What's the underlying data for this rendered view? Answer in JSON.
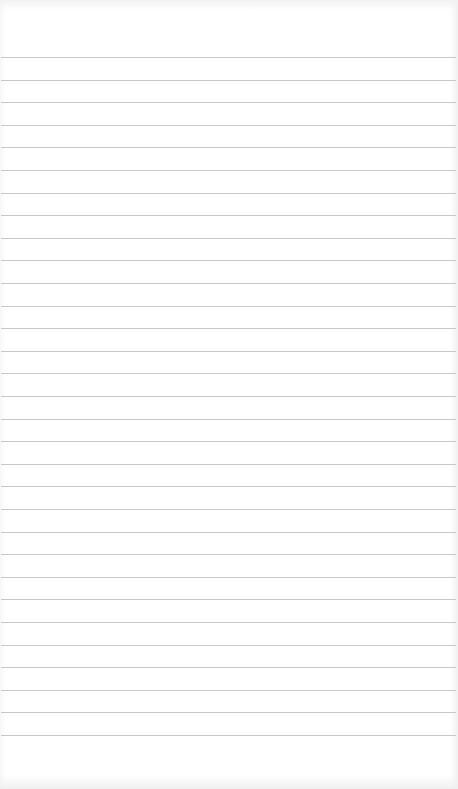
{
  "page": {
    "type": "lined-paper",
    "line_count": 31,
    "first_line_y": 57,
    "line_spacing": 22.6,
    "line_color": "#c9c9c9",
    "background_color": "#ffffff"
  }
}
